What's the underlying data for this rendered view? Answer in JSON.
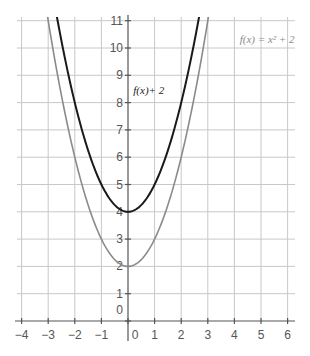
{
  "chart_data": {
    "type": "line",
    "title": "",
    "xlabel": "",
    "ylabel": "",
    "xlim": [
      -4,
      6
    ],
    "ylim": [
      0,
      11
    ],
    "grid": true,
    "x_ticks": [
      -4,
      -3,
      -2,
      -1,
      0,
      1,
      2,
      3,
      4,
      5,
      6
    ],
    "y_ticks": [
      0,
      1,
      2,
      3,
      4,
      5,
      6,
      7,
      8,
      9,
      10,
      11
    ],
    "x_tick_labels": [
      "−4",
      "−3",
      "−2",
      "−1",
      "0",
      "1",
      "2",
      "3",
      "4",
      "5",
      "6"
    ],
    "y_tick_labels": [
      "0",
      "1",
      "2",
      "3",
      "4",
      "5",
      "6",
      "7",
      "8",
      "9",
      "10",
      "11"
    ],
    "series": [
      {
        "name": "f(x) = x² + 2",
        "label_text": "f(x) = x² + 2",
        "expression": "x^2 + 2",
        "color": "#8a8a8a",
        "x": [
          -3,
          -2.5,
          -2,
          -1.5,
          -1,
          -0.5,
          0,
          0.5,
          1,
          1.5,
          2,
          2.5,
          3
        ],
        "values": [
          11,
          8.25,
          6,
          4.25,
          3,
          2.25,
          2,
          2.25,
          3,
          4.25,
          6,
          8.25,
          11
        ]
      },
      {
        "name": "f(x) + 2",
        "label_text": "f(x)+ 2",
        "expression": "x^2 + 4",
        "color": "#1a1a1a",
        "x": [
          -2.65,
          -2.5,
          -2,
          -1.5,
          -1,
          -0.5,
          0,
          0.5,
          1,
          1.5,
          2,
          2.5,
          2.65
        ],
        "values": [
          11,
          10.25,
          8,
          6.25,
          5,
          4.25,
          4,
          4.25,
          5,
          6.25,
          8,
          10.25,
          11
        ]
      }
    ],
    "annotations": [
      {
        "text": "f(x) = x² + 2",
        "x": 4.2,
        "y": 10.2
      },
      {
        "text": "f(x)+ 2",
        "x": 0.2,
        "y": 8.3
      }
    ]
  }
}
